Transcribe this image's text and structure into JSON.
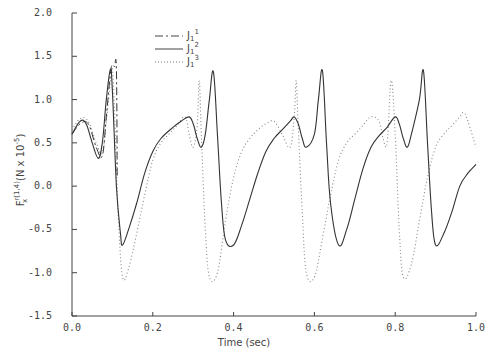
{
  "chart_data": {
    "type": "line",
    "title": "",
    "xlabel": "Time (sec)",
    "ylabel": "F_x^{r(1,4)} (N x 10^-5)",
    "ylabel_parts": {
      "base": "F",
      "sub": "x",
      "sup": "r(1,4)",
      "units": "(N x 10",
      "units_exp": "-5",
      "units_close": ")"
    },
    "xlim": [
      0.0,
      1.0
    ],
    "ylim": [
      -1.5,
      2.0
    ],
    "x_ticks": [
      "0.0",
      "0.2",
      "0.4",
      "0.6",
      "0.8",
      "1.0"
    ],
    "y_ticks": [
      "2.0",
      "1.5",
      "1.0",
      "0.5",
      "0.0",
      "-0.5",
      "-1.0",
      "-1.5"
    ],
    "grid": false,
    "legend_position": "upper-left-inside",
    "series": [
      {
        "name": "J1^1",
        "label_base": "J",
        "label_sub": "1",
        "label_sup": "1",
        "style": "dash-dot",
        "x": [
          0.0,
          0.02,
          0.04,
          0.06,
          0.075,
          0.085,
          0.095,
          0.1,
          0.105,
          0.11,
          0.112
        ],
        "y": [
          0.6,
          0.72,
          0.72,
          0.45,
          0.35,
          0.8,
          1.3,
          1.4,
          1.38,
          1.36,
          0.1
        ]
      },
      {
        "name": "J1^2",
        "label_base": "J",
        "label_sub": "1",
        "label_sup": "2",
        "style": "solid",
        "x": [
          0.0,
          0.02,
          0.035,
          0.05,
          0.065,
          0.075,
          0.085,
          0.095,
          0.1,
          0.11,
          0.12,
          0.125,
          0.14,
          0.16,
          0.18,
          0.2,
          0.22,
          0.25,
          0.27,
          0.29,
          0.3,
          0.31,
          0.32,
          0.33,
          0.34,
          0.35,
          0.36,
          0.37,
          0.38,
          0.4,
          0.42,
          0.44,
          0.46,
          0.48,
          0.5,
          0.52,
          0.54,
          0.55,
          0.56,
          0.57,
          0.58,
          0.6,
          0.61,
          0.62,
          0.63,
          0.64,
          0.66,
          0.68,
          0.7,
          0.72,
          0.74,
          0.76,
          0.78,
          0.8,
          0.81,
          0.82,
          0.83,
          0.84,
          0.86,
          0.87,
          0.88,
          0.89,
          0.9,
          0.92,
          0.94,
          0.96,
          0.98,
          1.0
        ],
        "y": [
          0.6,
          0.75,
          0.72,
          0.5,
          0.32,
          0.5,
          1.0,
          1.35,
          1.1,
          0.0,
          -0.55,
          -0.68,
          -0.5,
          -0.2,
          0.15,
          0.4,
          0.55,
          0.68,
          0.75,
          0.8,
          0.72,
          0.55,
          0.45,
          0.6,
          1.0,
          1.32,
          0.6,
          -0.2,
          -0.62,
          -0.68,
          -0.45,
          -0.15,
          0.15,
          0.4,
          0.55,
          0.65,
          0.75,
          0.8,
          0.72,
          0.55,
          0.45,
          0.6,
          1.0,
          1.33,
          0.5,
          -0.2,
          -0.68,
          -0.5,
          -0.15,
          0.2,
          0.45,
          0.58,
          0.68,
          0.8,
          0.72,
          0.55,
          0.45,
          0.6,
          1.0,
          1.33,
          0.5,
          -0.3,
          -0.68,
          -0.55,
          -0.3,
          0.0,
          0.15,
          0.25
        ]
      },
      {
        "name": "J1^3",
        "label_base": "J",
        "label_sub": "1",
        "label_sup": "3",
        "style": "dotted",
        "x": [
          0.0,
          0.02,
          0.04,
          0.06,
          0.075,
          0.085,
          0.095,
          0.1,
          0.105,
          0.11,
          0.115,
          0.125,
          0.14,
          0.16,
          0.18,
          0.2,
          0.22,
          0.24,
          0.26,
          0.28,
          0.29,
          0.3,
          0.31,
          0.315,
          0.32,
          0.33,
          0.34,
          0.36,
          0.38,
          0.4,
          0.42,
          0.44,
          0.46,
          0.48,
          0.5,
          0.52,
          0.54,
          0.55,
          0.555,
          0.56,
          0.57,
          0.58,
          0.6,
          0.62,
          0.64,
          0.66,
          0.68,
          0.7,
          0.72,
          0.74,
          0.76,
          0.77,
          0.78,
          0.79,
          0.8,
          0.81,
          0.82,
          0.84,
          0.86,
          0.88,
          0.9,
          0.92,
          0.94,
          0.96,
          0.97,
          0.98,
          1.0
        ],
        "y": [
          0.65,
          0.78,
          0.75,
          0.5,
          0.38,
          0.75,
          1.2,
          1.35,
          0.9,
          0.2,
          -0.4,
          -1.05,
          -0.95,
          -0.55,
          -0.1,
          0.3,
          0.5,
          0.6,
          0.7,
          0.8,
          0.6,
          0.45,
          0.7,
          1.22,
          0.6,
          -0.5,
          -1.05,
          -1.0,
          -0.4,
          0.1,
          0.4,
          0.55,
          0.65,
          0.72,
          0.75,
          0.6,
          0.45,
          0.8,
          1.22,
          0.7,
          -0.3,
          -1.0,
          -1.05,
          -0.6,
          -0.1,
          0.3,
          0.5,
          0.6,
          0.7,
          0.8,
          0.75,
          0.55,
          0.5,
          1.22,
          0.6,
          -0.5,
          -1.05,
          -0.9,
          -0.4,
          0.1,
          0.45,
          0.6,
          0.7,
          0.8,
          0.85,
          0.75,
          0.45
        ]
      }
    ]
  },
  "plot_area": {
    "x0": 72,
    "x1": 476,
    "y_top": 13,
    "y_bottom": 316
  }
}
